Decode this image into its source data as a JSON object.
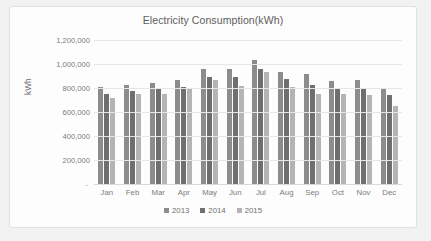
{
  "chart_data": {
    "type": "bar",
    "title": "Electricity Consumption(kWh)",
    "xlabel": "",
    "ylabel": "kWh",
    "ylim": [
      0,
      1200000
    ],
    "ytick_labels": [
      "1,200,000",
      "1,000,000",
      "800,000",
      "600,000",
      "400,000",
      "200,000",
      "-"
    ],
    "ytick_values": [
      1200000,
      1000000,
      800000,
      600000,
      400000,
      200000,
      0
    ],
    "ytick_step": 200000,
    "grid": true,
    "legend_position": "bottom",
    "categories": [
      "Jan",
      "Feb",
      "Mar",
      "Apr",
      "May",
      "Jun",
      "Jul",
      "Aug",
      "Sep",
      "Oct",
      "Nov",
      "Dec"
    ],
    "series": [
      {
        "name": "2013",
        "color": "#8c8c8c",
        "values": [
          805000,
          825000,
          840000,
          865000,
          955000,
          955000,
          1030000,
          935000,
          920000,
          860000,
          868000,
          792000
        ]
      },
      {
        "name": "2014",
        "color": "#6f6f6f",
        "values": [
          750000,
          778000,
          802000,
          810000,
          888000,
          890000,
          958000,
          878000,
          822000,
          802000,
          798000,
          740000
        ]
      },
      {
        "name": "2015",
        "color": "#b4b4b4",
        "values": [
          718000,
          750000,
          748000,
          788000,
          868000,
          818000,
          935000,
          812000,
          750000,
          748000,
          740000,
          648000
        ]
      }
    ]
  },
  "legend": {
    "items": [
      {
        "label": "2013",
        "color": "#8c8c8c"
      },
      {
        "label": "2014",
        "color": "#6f6f6f"
      },
      {
        "label": "2015",
        "color": "#b4b4b4"
      }
    ]
  }
}
